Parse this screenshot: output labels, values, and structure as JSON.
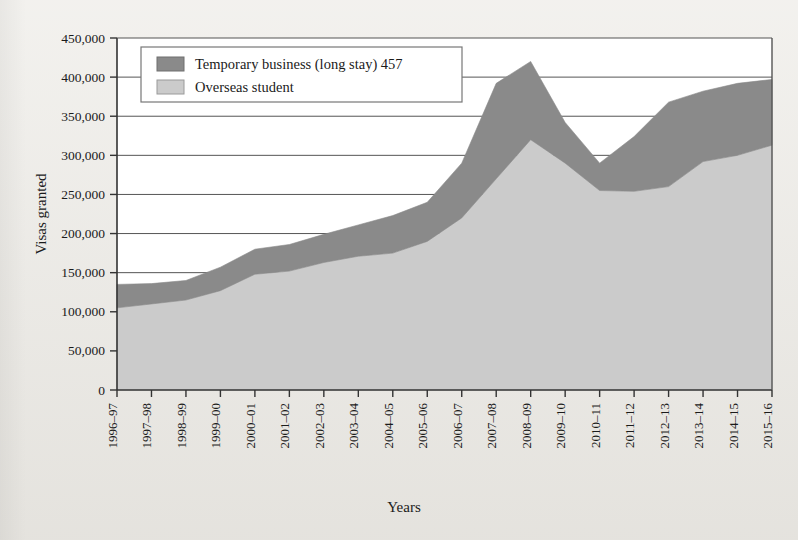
{
  "chart_data": {
    "type": "area",
    "title": "",
    "xlabel": "Years",
    "ylabel": "Visas granted",
    "stacked": true,
    "grid": true,
    "legend_position": "top-left-inside",
    "ylim": [
      0,
      450000
    ],
    "yticks": [
      0,
      50000,
      100000,
      150000,
      200000,
      250000,
      300000,
      350000,
      400000,
      450000
    ],
    "ytick_labels": [
      "0",
      "50,000",
      "100,000",
      "150,000",
      "200,000",
      "250,000",
      "300,000",
      "350,000",
      "400,000",
      "450,000"
    ],
    "categories": [
      "1996–97",
      "1997–98",
      "1998–99",
      "1999–00",
      "2000–01",
      "2001–02",
      "2002–03",
      "2003–04",
      "2004–05",
      "2005–06",
      "2006–07",
      "2007–08",
      "2008–09",
      "2009–10",
      "2010–11",
      "2011–12",
      "2012–13",
      "2013–14",
      "2014–15",
      "2015–16"
    ],
    "series": [
      {
        "name": "Overseas student",
        "color": "#cbcbcb",
        "values": [
          105000,
          110000,
          115000,
          127000,
          148000,
          152000,
          163000,
          171000,
          175000,
          190000,
          220000,
          270000,
          320000,
          290000,
          255000,
          254000,
          260000,
          292000,
          300000,
          313000
        ]
      },
      {
        "name": "Temporary business (long stay) 457",
        "color": "#8a8a8a",
        "values": [
          30000,
          26000,
          25000,
          30000,
          32000,
          34000,
          36000,
          40000,
          48000,
          50000,
          70000,
          122000,
          100000,
          52000,
          35000,
          70000,
          108000,
          90000,
          92000,
          84000
        ]
      }
    ],
    "totals": [
      135000,
      136000,
      140000,
      157000,
      180000,
      186000,
      199000,
      211000,
      223000,
      240000,
      290000,
      392000,
      420000,
      342000,
      290000,
      324000,
      368000,
      382000,
      392000,
      397000
    ]
  },
  "legend": {
    "items": [
      {
        "label": "Temporary business (long stay) 457",
        "swatch": "#8a8a8a"
      },
      {
        "label": "Overseas student",
        "swatch": "#cbcbcb"
      }
    ]
  },
  "axes": {
    "y_title": "Visas granted",
    "x_title": "Years"
  }
}
